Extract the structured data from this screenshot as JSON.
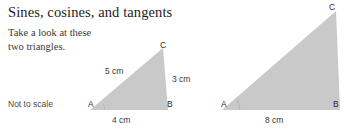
{
  "page": {
    "title": "Sines, cosines, and tangents",
    "intro_line_1": "Take a look at these",
    "intro_line_2": "two triangles.",
    "scale_note": "Not to scale",
    "background_color": "#ffffff",
    "title_color": "#1c1c1c",
    "triangle_fill_color": "#c9c9c9"
  },
  "figure": {
    "triangles": [
      {
        "name": "small-triangle",
        "vertices": [
          {
            "label": "A",
            "x": 90,
            "y": 110
          },
          {
            "label": "B",
            "x": 168,
            "y": 110
          },
          {
            "label": "C",
            "x": 163,
            "y": 48
          }
        ],
        "sides": {
          "hypotenuse": "5 cm",
          "vertical": "3 cm",
          "base": "4 cm"
        }
      },
      {
        "name": "large-triangle",
        "vertices": [
          {
            "label": "A",
            "x": 222,
            "y": 110
          },
          {
            "label": "B",
            "x": 340,
            "y": 110
          },
          {
            "label": "C",
            "x": 336,
            "y": 11
          }
        ],
        "sides": {
          "hypotenuse": "",
          "vertical": "",
          "base": "8 cm"
        }
      }
    ]
  }
}
